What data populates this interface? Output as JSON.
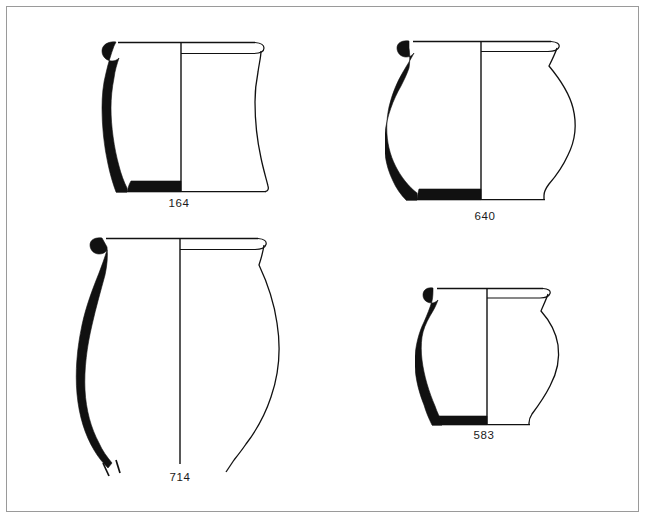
{
  "plate": {
    "kind": "archaeological-pottery-profile-plate",
    "description": "Line-drawing plate of four ceramic vessel profiles; each drawing shows a solid-black half cross-section on the left and a thin-line exterior elevation on the right, separated by a vertical centre axis.",
    "background_color": "#ffffff",
    "ink_color": "#111111",
    "frame_color": "#9a9a9a",
    "width": 648,
    "height": 527,
    "vessel_count": 4
  },
  "vessels": [
    {
      "id": "164",
      "label": "164",
      "position": "top-left",
      "form": "bucket-shaped jar, everted rolled rim, flat base, straight tapering walls",
      "rim_type": "everted rolled rim",
      "base_type": "flat base",
      "complete": true,
      "drawing_width_px": 175,
      "drawing_height_px": 160,
      "label_x": 179,
      "label_y": 198
    },
    {
      "id": "640",
      "label": "640",
      "position": "top-right",
      "form": "globular jar, short everted hooked rim, rounded shoulder, flat base",
      "rim_type": "everted hooked rim",
      "base_type": "flat base",
      "complete": true,
      "drawing_width_px": 180,
      "drawing_height_px": 170,
      "label_x": 485,
      "label_y": 211
    },
    {
      "id": "714",
      "label": "714",
      "position": "bottom-left",
      "form": "large ovoid storage jar, everted hooked rim, lower body broken away",
      "rim_type": "everted hooked rim",
      "base_type": "missing / broken",
      "complete": false,
      "break_marks": true,
      "drawing_width_px": 200,
      "drawing_height_px": 230,
      "label_x": 180,
      "label_y": 472
    },
    {
      "id": "583",
      "label": "583",
      "position": "bottom-right",
      "form": "small jar, everted rim, high rounded shoulder, tapering body, flat base",
      "rim_type": "everted rim",
      "base_type": "flat base",
      "complete": true,
      "drawing_width_px": 145,
      "drawing_height_px": 140,
      "label_x": 484,
      "label_y": 430
    }
  ],
  "legend": {
    "section_fill": "solid black = cut wall of vessel (section)",
    "outline": "thin line = exterior profile (elevation)",
    "axis": "vertical line = axis of rotation / centre line",
    "hatch": "short oblique strokes = broken edge"
  }
}
